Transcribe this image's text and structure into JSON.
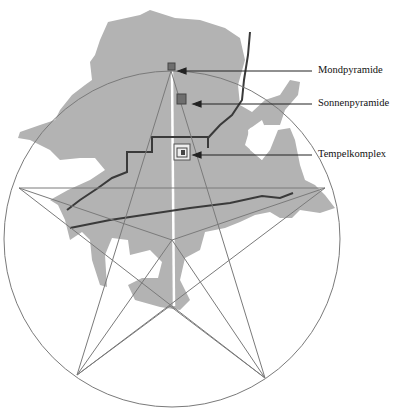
{
  "diagram": {
    "type": "map overlay with pentagram",
    "labels": [
      {
        "id": "mondpyramide",
        "text": "Mondpyramide"
      },
      {
        "id": "sonnenpyramide",
        "text": "Sonnenpyramide"
      },
      {
        "id": "tempelkomplex",
        "text": "Tempelkomplex"
      }
    ],
    "colors": {
      "land": "#b3b3b3",
      "lines": "#7a7a7a",
      "roads": "#3a3a3a",
      "pyramid": "#6e6e6e",
      "axis": "#ffffff"
    }
  }
}
